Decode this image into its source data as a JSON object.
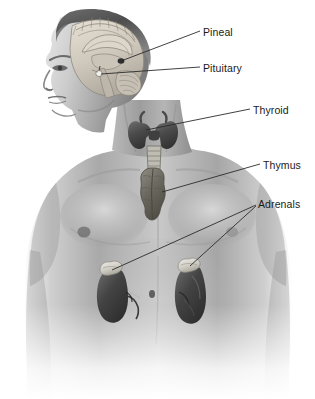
{
  "figure": {
    "style": "grayscale medical illustration",
    "background_color": "#ffffff",
    "label_color": "#1a1a1a",
    "leader_line_color": "#333333",
    "width": 315,
    "height": 399
  },
  "labels": [
    {
      "id": "pineal",
      "text": "Pineal",
      "x": 203,
      "y": 27,
      "target": "pineal gland in brain"
    },
    {
      "id": "pituitary",
      "text": "Pituitary",
      "x": 203,
      "y": 63,
      "target": "pituitary gland in brain"
    },
    {
      "id": "thyroid",
      "text": "Thyroid",
      "x": 253,
      "y": 105,
      "target": "thyroid gland in neck"
    },
    {
      "id": "thymus",
      "text": "Thymus",
      "x": 263,
      "y": 160,
      "target": "thymus in upper chest"
    },
    {
      "id": "adrenals",
      "text": "Adrenals",
      "x": 258,
      "y": 199,
      "target": "adrenal glands atop both kidneys"
    }
  ],
  "organs": [
    {
      "id": "brain",
      "name": "brain-sagittal-section"
    },
    {
      "id": "pineal-gland",
      "name": "pineal-gland"
    },
    {
      "id": "pituitary-gland",
      "name": "pituitary-gland"
    },
    {
      "id": "thyroid-gland",
      "name": "thyroid-gland"
    },
    {
      "id": "trachea",
      "name": "trachea"
    },
    {
      "id": "thymus-gland",
      "name": "thymus-gland"
    },
    {
      "id": "kidney-left",
      "name": "kidney-left"
    },
    {
      "id": "kidney-right",
      "name": "kidney-right"
    },
    {
      "id": "adrenal-left",
      "name": "adrenal-gland-left"
    },
    {
      "id": "adrenal-right",
      "name": "adrenal-gland-right"
    }
  ]
}
